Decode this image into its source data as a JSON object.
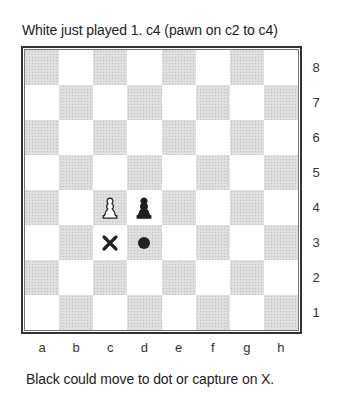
{
  "captions": {
    "top": "White just played 1. c4 (pawn on c2 to c4)",
    "bottom": "Black could move to dot or capture on X."
  },
  "board": {
    "files": [
      "a",
      "b",
      "c",
      "d",
      "e",
      "f",
      "g",
      "h"
    ],
    "ranks": [
      "8",
      "7",
      "6",
      "5",
      "4",
      "3",
      "2",
      "1"
    ],
    "light_color": "#ffffff",
    "dark_color": "#dcdcdc",
    "pieces": [
      {
        "square": "c4",
        "type": "pawn",
        "color": "white"
      },
      {
        "square": "d4",
        "type": "pawn",
        "color": "black"
      }
    ],
    "markers": [
      {
        "square": "c3",
        "type": "x-mark",
        "meaning": "capture"
      },
      {
        "square": "d3",
        "type": "dot",
        "meaning": "move"
      }
    ]
  }
}
